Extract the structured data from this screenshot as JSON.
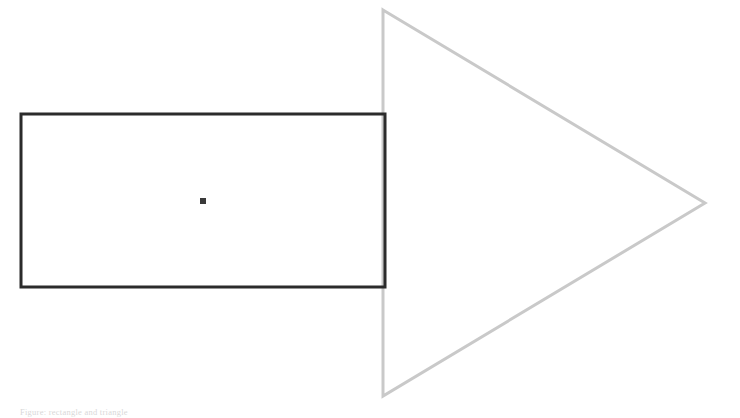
{
  "page": {
    "background_color": "#ffffff",
    "width": 740,
    "height": 418
  },
  "figure": {
    "rectangle": {
      "label": "rectangle-outline",
      "stroke_color": "#2b2b2b",
      "stroke_width": 3,
      "fill": "none",
      "x": 21,
      "y": 114,
      "width": 364,
      "height": 173
    },
    "triangle": {
      "label": "triangle-outline",
      "stroke_color": "#c9c9c9",
      "stroke_width": 3,
      "fill": "none",
      "points": "383,10 705,203 383,396",
      "vertices": [
        {
          "name": "top",
          "x": 383,
          "y": 10
        },
        {
          "name": "apex-right",
          "x": 705,
          "y": 203
        },
        {
          "name": "bottom",
          "x": 383,
          "y": 396
        }
      ]
    },
    "center_marker": {
      "label": "center-point-marker",
      "fill_color": "#3a3a3a",
      "x": 200,
      "y": 198,
      "size": 6
    }
  },
  "caption": {
    "text": "Figure: rectangle and triangle"
  }
}
